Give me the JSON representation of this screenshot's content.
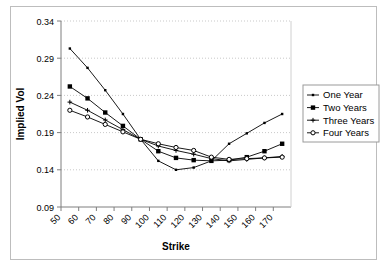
{
  "chart_data": {
    "type": "line",
    "title": "",
    "xlabel": "Strike",
    "ylabel": "Implied Vol",
    "xlim": [
      50,
      180
    ],
    "ylim": [
      0.09,
      0.34
    ],
    "xticks": [
      50,
      60,
      70,
      80,
      90,
      100,
      110,
      120,
      130,
      140,
      150,
      160,
      170
    ],
    "yticks": [
      0.09,
      0.14,
      0.19,
      0.24,
      0.29,
      0.34
    ],
    "ytick_labels": [
      "0.09",
      "0.14",
      "0.19",
      "0.24",
      "0.29",
      "0.34"
    ],
    "xtick_labels": [
      "50",
      "60",
      "70",
      "80",
      "90",
      "100",
      "110",
      "120",
      "130",
      "140",
      "150",
      "160",
      "170"
    ],
    "grid": "horizontal-dotted",
    "legend_position": "right",
    "x": [
      55,
      65,
      75,
      85,
      95,
      105,
      115,
      125,
      135,
      145,
      155,
      165,
      175
    ],
    "series": [
      {
        "name": "One Year",
        "marker": "small-dot",
        "color": "#000000",
        "values": [
          0.303,
          0.277,
          0.247,
          0.215,
          0.181,
          0.152,
          0.14,
          0.143,
          0.152,
          0.175,
          0.189,
          0.203,
          0.215
        ]
      },
      {
        "name": "Two Years",
        "marker": "filled-square",
        "color": "#000000",
        "values": [
          0.252,
          0.236,
          0.217,
          0.199,
          0.181,
          0.165,
          0.156,
          0.153,
          0.152,
          0.153,
          0.157,
          0.165,
          0.175
        ]
      },
      {
        "name": "Three Years",
        "marker": "small-plus",
        "color": "#000000",
        "values": [
          0.231,
          0.22,
          0.207,
          0.194,
          0.181,
          0.172,
          0.166,
          0.161,
          0.155,
          0.152,
          0.154,
          0.156,
          0.158
        ]
      },
      {
        "name": "Four Years",
        "marker": "open-circle",
        "color": "#000000",
        "values": [
          0.22,
          0.211,
          0.201,
          0.191,
          0.181,
          0.175,
          0.17,
          0.166,
          0.157,
          0.154,
          0.155,
          0.156,
          0.157
        ]
      }
    ]
  },
  "legend": {
    "items": [
      {
        "label": "One Year"
      },
      {
        "label": "Two Years"
      },
      {
        "label": "Three Years"
      },
      {
        "label": "Four Years"
      }
    ]
  }
}
